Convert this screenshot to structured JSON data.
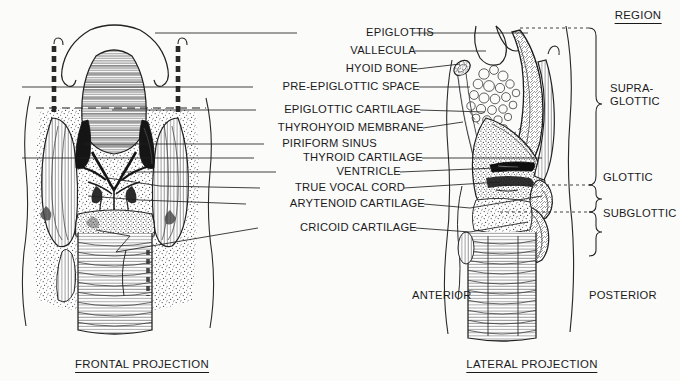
{
  "figure": {
    "background_color": "#fbfbfa",
    "ink_color": "#1a1a1a"
  },
  "captions": {
    "frontal": "FRONTAL PROJECTION",
    "lateral": "LATERAL PROJECTION"
  },
  "orientation": {
    "anterior": "ANTERIOR",
    "posterior": "POSTERIOR"
  },
  "region_column": {
    "header": "REGION",
    "items": [
      {
        "label": "SUPRA-",
        "label2": "GLOTTIC",
        "name": "supraglottic"
      },
      {
        "label": "GLOTTIC",
        "label2": "",
        "name": "glottic"
      },
      {
        "label": "SUBGLOTTIC",
        "label2": "",
        "name": "subglottic"
      }
    ]
  },
  "structure_labels": [
    {
      "text": "EPIGLOTTIS",
      "y": 33,
      "x": 355,
      "left_leader": true,
      "right_leader": true
    },
    {
      "text": "VALLECULA",
      "y": 51,
      "x": 355,
      "left_leader": false,
      "right_leader": true
    },
    {
      "text": "HYOID BONE",
      "y": 69,
      "x": 355,
      "left_leader": false,
      "right_leader": true
    },
    {
      "text": "PRE-EPIGLOTTIC SPACE",
      "y": 87,
      "x": 355,
      "left_leader": true,
      "right_leader": true
    },
    {
      "text": "EPIGLOTTIC CARTILAGE",
      "y": 110,
      "x": 355,
      "left_leader": true,
      "right_leader": true
    },
    {
      "text": "THYROHYOID MEMBRANE",
      "y": 128,
      "x": 355,
      "left_leader": false,
      "right_leader": true
    },
    {
      "text": "PIRIFORM SINUS",
      "y": 144,
      "x": 355,
      "left_leader": true,
      "right_leader": false
    },
    {
      "text": "THYROID CARTILAGE",
      "y": 158,
      "x": 355,
      "left_leader": true,
      "right_leader": true
    },
    {
      "text": "VENTRICLE",
      "y": 172,
      "x": 355,
      "left_leader": true,
      "right_leader": true
    },
    {
      "text": "TRUE VOCAL CORD",
      "y": 188,
      "x": 355,
      "left_leader": true,
      "right_leader": true
    },
    {
      "text": "ARYTENOID CARTILAGE",
      "y": 204,
      "x": 355,
      "left_leader": true,
      "right_leader": true
    },
    {
      "text": "CRICOID CARTILAGE",
      "y": 228,
      "x": 355,
      "left_leader": true,
      "right_leader": true
    }
  ]
}
